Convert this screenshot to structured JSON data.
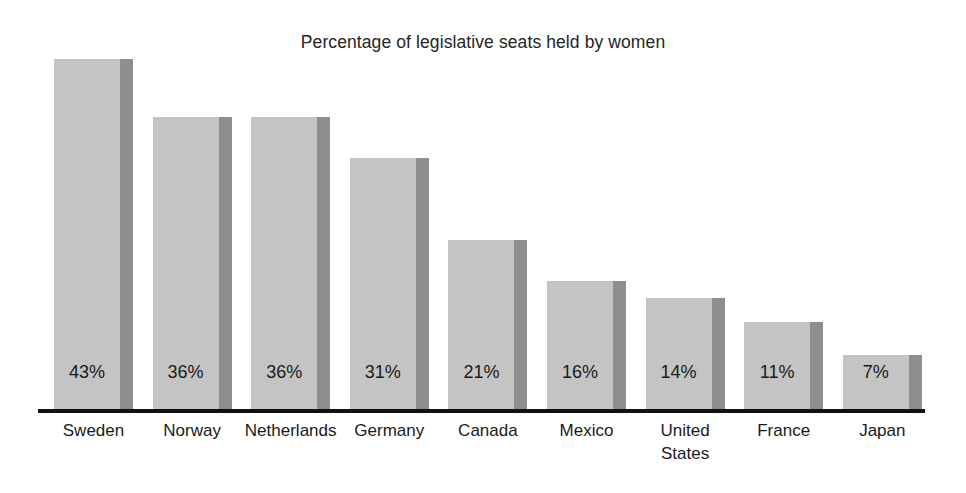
{
  "chart_data": {
    "type": "bar",
    "title": "Percentage of legislative seats held by women",
    "xlabel": "",
    "ylabel": "",
    "ylim": [
      0,
      47
    ],
    "grid": false,
    "legend": false,
    "value_suffix": "%",
    "categories": [
      "Sweden",
      "Norway",
      "Netherlands",
      "Germany",
      "Canada",
      "Mexico",
      "United States",
      "France",
      "Japan"
    ],
    "values": [
      43,
      36,
      36,
      31,
      21,
      16,
      14,
      11,
      7
    ],
    "value_labels": [
      "43%",
      "36%",
      "36%",
      "31%",
      "21%",
      "16%",
      "14%",
      "11%",
      "7%"
    ],
    "colors": {
      "bar_face": "#c4c4c4",
      "bar_shadow": "#8e8e8e",
      "axis": "#111111",
      "text": "#1a1a1a",
      "background": "#ffffff"
    }
  },
  "bars": [
    {
      "label": "Sweden",
      "label_lines": [
        "Sweden"
      ],
      "value_label": "43%",
      "value": 43
    },
    {
      "label": "Norway",
      "label_lines": [
        "Norway"
      ],
      "value_label": "36%",
      "value": 36
    },
    {
      "label": "Netherlands",
      "label_lines": [
        "Netherlands"
      ],
      "value_label": "36%",
      "value": 36
    },
    {
      "label": "Germany",
      "label_lines": [
        "Germany"
      ],
      "value_label": "31%",
      "value": 31
    },
    {
      "label": "Canada",
      "label_lines": [
        "Canada"
      ],
      "value_label": "21%",
      "value": 21
    },
    {
      "label": "Mexico",
      "label_lines": [
        "Mexico"
      ],
      "value_label": "16%",
      "value": 16
    },
    {
      "label": "United States",
      "label_lines": [
        "United",
        "States"
      ],
      "value_label": "14%",
      "value": 14
    },
    {
      "label": "France",
      "label_lines": [
        "France"
      ],
      "value_label": "11%",
      "value": 11
    },
    {
      "label": "Japan",
      "label_lines": [
        "Japan"
      ],
      "value_label": "7%",
      "value": 7
    }
  ]
}
